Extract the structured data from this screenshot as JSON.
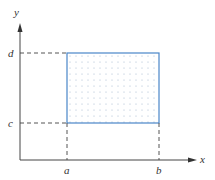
{
  "diagram": {
    "axes": {
      "x_label": "x",
      "y_label": "y"
    },
    "ticks": {
      "x": [
        "a",
        "b"
      ],
      "y": [
        "c",
        "d"
      ]
    },
    "region": {
      "shape": "rectangle",
      "fill": "dotted",
      "border_color": "#4a86c8",
      "dot_color": "#9fb4cc"
    },
    "colors": {
      "axis": "#444444",
      "dashed_guides": "#555555"
    }
  }
}
